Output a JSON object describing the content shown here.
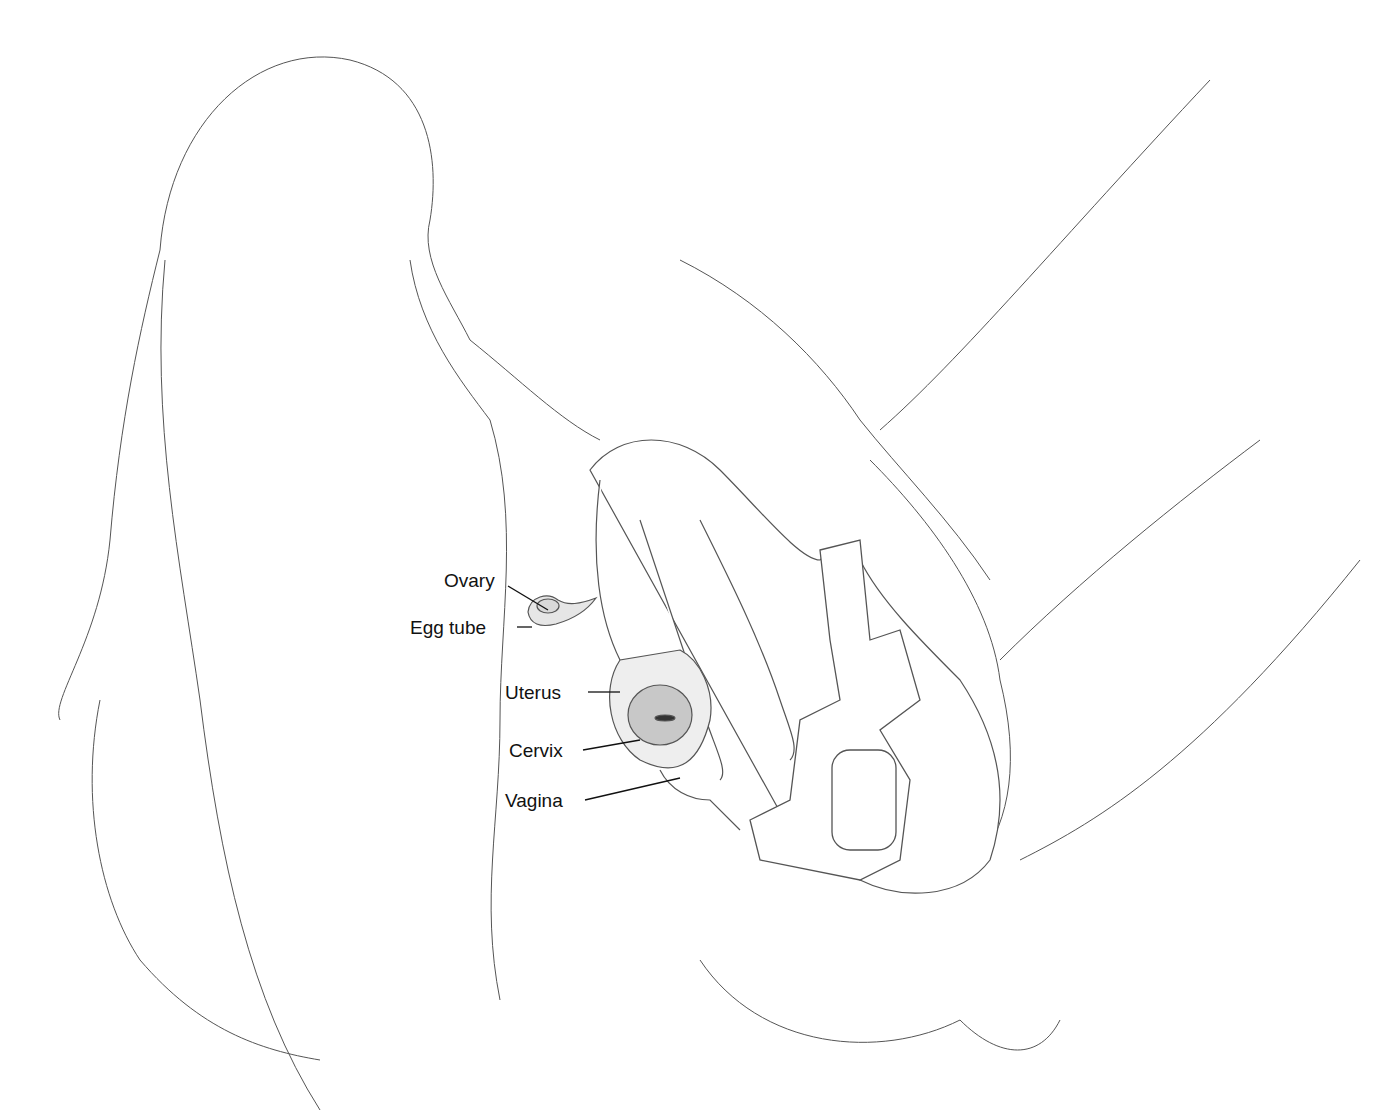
{
  "diagram": {
    "kind": "anatomical line illustration",
    "labels": [
      {
        "id": "ovary",
        "text": "Ovary",
        "x": 444,
        "y": 571
      },
      {
        "id": "egg-tube",
        "text": "Egg tube",
        "x": 410,
        "y": 618
      },
      {
        "id": "uterus",
        "text": "Uterus",
        "x": 505,
        "y": 683
      },
      {
        "id": "cervix",
        "text": "Cervix",
        "x": 509,
        "y": 741
      },
      {
        "id": "vagina",
        "text": "Vagina",
        "x": 505,
        "y": 791
      }
    ],
    "colors": {
      "line": "#555555",
      "text": "#111111",
      "shade": "#d9d9d9",
      "background": "#ffffff"
    }
  }
}
